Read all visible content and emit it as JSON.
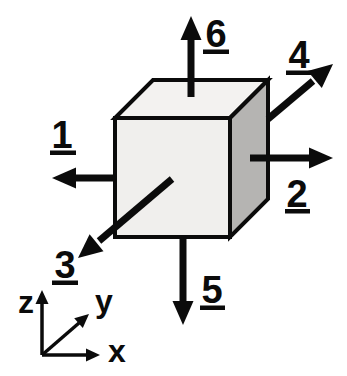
{
  "diagram": {
    "face_arrows": [
      {
        "number": "1",
        "direction": "-x (left)"
      },
      {
        "number": "2",
        "direction": "+x (right)"
      },
      {
        "number": "3",
        "direction": "-y (toward viewer, down-left)"
      },
      {
        "number": "4",
        "direction": "+y (away from viewer, up-right)"
      },
      {
        "number": "5",
        "direction": "-z (down)"
      },
      {
        "number": "6",
        "direction": "+z (up)"
      }
    ],
    "axes": {
      "x_label": "x",
      "y_label": "y",
      "z_label": "z"
    },
    "colors": {
      "background": "#ffffff",
      "cube_front_face": "#f0efed",
      "cube_top_face": "#f3f2f0",
      "cube_right_face": "#b5b4b2",
      "ink": "#0b0b0b"
    }
  }
}
